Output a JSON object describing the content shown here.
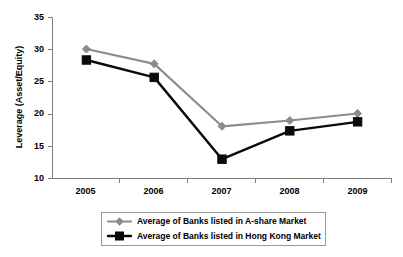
{
  "chart_data": {
    "type": "line",
    "title": "",
    "xlabel": "",
    "ylabel": "Leverage (Asset/Equity)",
    "categories": [
      "2005",
      "2006",
      "2007",
      "2008",
      "2009"
    ],
    "series": [
      {
        "name": "Average of Banks listed in A-share Market",
        "color": "#8c8c8c",
        "marker": "diamond",
        "values": [
          30.1,
          27.8,
          18.1,
          19.0,
          20.1
        ]
      },
      {
        "name": "Average of Banks listed in Hong Kong Market",
        "color": "#0a0a0a",
        "marker": "square",
        "values": [
          28.4,
          25.7,
          13.0,
          17.4,
          18.8
        ]
      }
    ],
    "ylim": [
      10,
      35
    ],
    "yticks": [
      "10",
      "15",
      "20",
      "25",
      "30",
      "35"
    ],
    "grid": false,
    "legend_position": "bottom"
  },
  "legend": {
    "entries": [
      {
        "label": "Average of Banks listed in A-share Market"
      },
      {
        "label": "Average of Banks listed in Hong Kong Market"
      }
    ]
  },
  "axes": {
    "y_label": "Leverage (Asset/Equity)",
    "y_tick_labels": [
      "35",
      "30",
      "25",
      "20",
      "15",
      "10"
    ],
    "x_tick_labels": [
      "2005",
      "2006",
      "2007",
      "2008",
      "2009"
    ]
  }
}
